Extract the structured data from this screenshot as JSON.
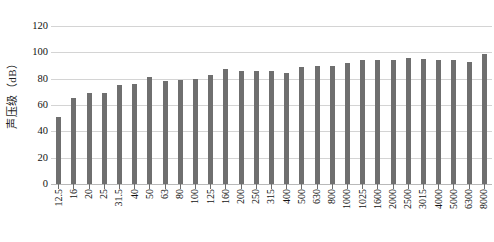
{
  "chart_data": {
    "type": "bar",
    "title": "",
    "subtitle": "",
    "xlabel": "",
    "ylabel": "声压级（dB）",
    "ylim": [
      0,
      120
    ],
    "ytick_values": [
      120,
      100,
      80,
      60,
      40,
      20,
      0
    ],
    "ytick_labels": [
      "120",
      "100",
      "80",
      "60",
      "40",
      "20",
      "0"
    ],
    "grid": true,
    "grid_axis": "y",
    "legend": false,
    "legend_position": "none",
    "bar_color": "#6f6f6f",
    "categories": [
      "12.5",
      "16",
      "20",
      "25",
      "31.5",
      "40",
      "50",
      "63",
      "80",
      "100",
      "125",
      "160",
      "200",
      "250",
      "315",
      "400",
      "500",
      "630",
      "800",
      "1000",
      "1025",
      "1600",
      "2000",
      "2500",
      "3015",
      "4000",
      "5000",
      "6300",
      "8000"
    ],
    "values": [
      51,
      65,
      69,
      69,
      75,
      76,
      81,
      78,
      79,
      80,
      83,
      87,
      86,
      86,
      86,
      84,
      89,
      90,
      90,
      92,
      94,
      94,
      94,
      96,
      95,
      94,
      94,
      93,
      99
    ]
  }
}
